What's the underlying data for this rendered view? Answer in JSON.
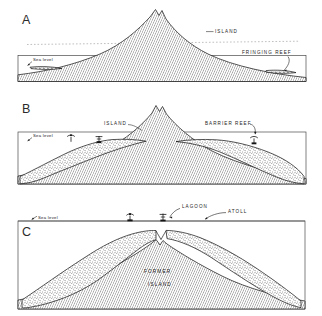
{
  "figure": {
    "background_color": "#ffffff",
    "ink_color": "#1c1c1c",
    "panels": [
      {
        "letter": "A",
        "stage": "fringing reef",
        "labels": [
          {
            "name": "island",
            "text": "ISLAND"
          },
          {
            "name": "fringing-reef",
            "text": "FRINGING REEF"
          },
          {
            "name": "sea-level",
            "text": "Sea level"
          }
        ]
      },
      {
        "letter": "B",
        "stage": "barrier reef",
        "labels": [
          {
            "name": "island",
            "text": "ISLAND"
          },
          {
            "name": "barrier-reef",
            "text": "BARRIER REEF"
          },
          {
            "name": "sea-level",
            "text": "Sea level"
          }
        ]
      },
      {
        "letter": "C",
        "stage": "atoll",
        "labels": [
          {
            "name": "lagoon",
            "text": "LAGOON"
          },
          {
            "name": "atoll",
            "text": "ATOLL"
          },
          {
            "name": "sea-level",
            "text": "Sea level"
          },
          {
            "name": "former-island-line1",
            "text": "FORMER"
          },
          {
            "name": "former-island-line2",
            "text": "ISLAND"
          }
        ]
      }
    ]
  }
}
